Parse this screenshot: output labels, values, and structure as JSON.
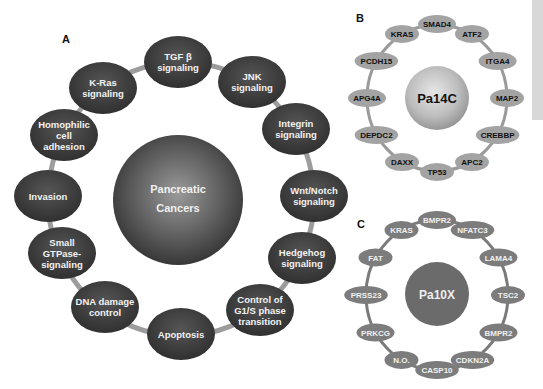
{
  "panels": {
    "A": {
      "letter": "A",
      "center_label": [
        "Pancreatic",
        "Cancers"
      ],
      "nodes": [
        {
          "lines": [
            "TGF β",
            "signaling"
          ],
          "x": 178,
          "y": 62
        },
        {
          "lines": [
            "JNK",
            "signaling"
          ],
          "x": 252,
          "y": 82
        },
        {
          "lines": [
            "Integrin",
            "signaling"
          ],
          "x": 296,
          "y": 129
        },
        {
          "lines": [
            "Wnt/Notch",
            "signaling"
          ],
          "x": 314,
          "y": 196
        },
        {
          "lines": [
            "Hedgehog",
            "signaling"
          ],
          "x": 302,
          "y": 258
        },
        {
          "lines": [
            "Control of",
            "G1/S phase",
            "transition"
          ],
          "x": 260,
          "y": 310
        },
        {
          "lines": [
            "Apoptosis"
          ],
          "x": 181,
          "y": 334
        },
        {
          "lines": [
            "DNA damage",
            "control"
          ],
          "x": 105,
          "y": 307
        },
        {
          "lines": [
            "Small",
            "GTPase-",
            "signaling"
          ],
          "x": 62,
          "y": 253
        },
        {
          "lines": [
            "Invasion"
          ],
          "x": 48,
          "y": 196
        },
        {
          "lines": [
            "Homophilic",
            "cell",
            "adhesion"
          ],
          "x": 64,
          "y": 135
        },
        {
          "lines": [
            "K-Ras",
            "signaling"
          ],
          "x": 103,
          "y": 88
        }
      ]
    },
    "B": {
      "letter": "B",
      "center_label": "Pa14C",
      "nodes": [
        "SMAD4",
        "ATF2",
        "ITGA4",
        "MAP2",
        "CREBBP",
        "APC2",
        "TP53",
        "DAXX",
        "DEPDC2",
        "APG4A",
        "PCDH15",
        "KRAS"
      ]
    },
    "C": {
      "letter": "C",
      "center_label": "Pa10X",
      "nodes": [
        "BMPR2",
        "NFATC3",
        "LAMA4",
        "TSC2",
        "BMPR2",
        "CDKN2A",
        "CASP10",
        "N.O.",
        "PRKCG",
        "PRSS23",
        "FAT",
        "KRAS"
      ]
    }
  },
  "colors": {
    "dark_node": "#3a3a3a",
    "light_node": "#9a9a9a",
    "mid_node": "#6e6e6e",
    "ring": "#9c9c9c"
  }
}
